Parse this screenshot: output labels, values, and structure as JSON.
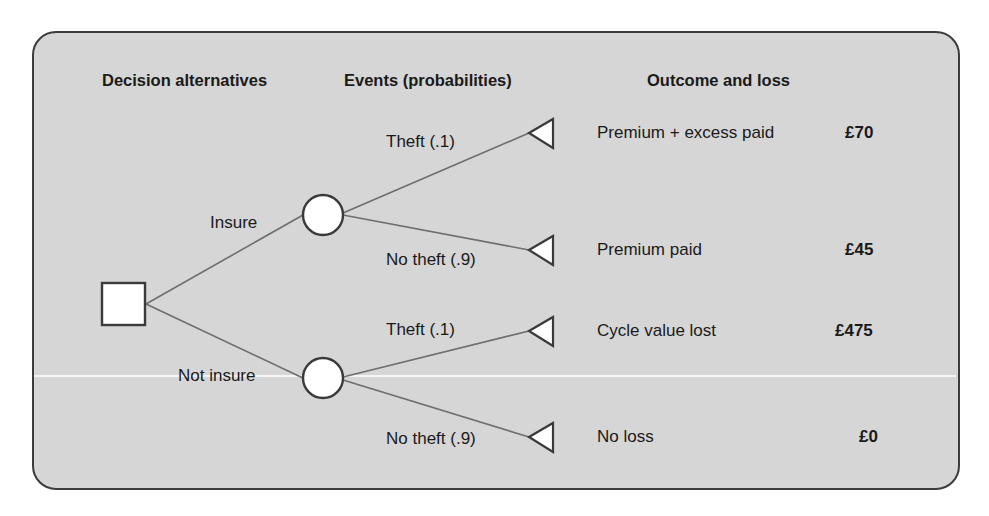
{
  "headers": {
    "decision": "Decision alternatives",
    "events": "Events (probabilities)",
    "outcome": "Outcome and loss"
  },
  "decisions": [
    {
      "label": "Insure"
    },
    {
      "label": "Not insure"
    }
  ],
  "events": [
    {
      "label": "Theft (.1)"
    },
    {
      "label": "No theft (.9)"
    },
    {
      "label": "Theft (.1)"
    },
    {
      "label": "No theft (.9)"
    }
  ],
  "outcomes": [
    {
      "label": "Premium + excess paid",
      "loss": "£70"
    },
    {
      "label": "Premium paid",
      "loss": "£45"
    },
    {
      "label": "Cycle value lost",
      "loss": "£475"
    },
    {
      "label": "No loss",
      "loss": "£0"
    }
  ],
  "colors": {
    "panel_bg": "#d6d6d6",
    "border": "#3c3c3c",
    "branch_line": "#6e6e6e",
    "node_fill": "#ffffff"
  }
}
